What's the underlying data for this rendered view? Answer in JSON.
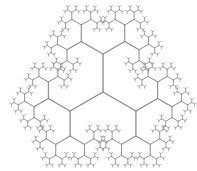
{
  "diagram": {
    "type": "fractal-tree",
    "center": [
      103,
      92
    ],
    "trunk_length": 38,
    "branch_ratio": 0.66,
    "branch_angle_deg": 60,
    "depth": 8,
    "root_directions_deg": [
      -90,
      150,
      30
    ],
    "stroke_color": "#8a8a8a",
    "background": "#ffffff"
  }
}
